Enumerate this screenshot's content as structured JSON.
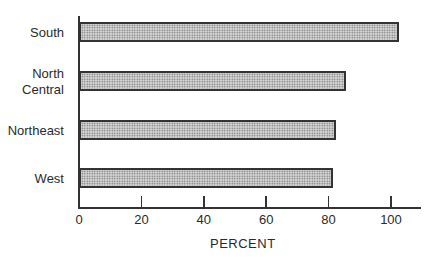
{
  "chart_data": {
    "type": "bar",
    "orientation": "horizontal",
    "title": "",
    "xlabel": "PERCENT",
    "ylabel": "",
    "categories": [
      "South",
      "North\nCentral",
      "Northeast",
      "West"
    ],
    "values": [
      102.5,
      85.5,
      82.5,
      81.5
    ],
    "xlim": [
      0,
      110
    ],
    "x_ticks": [
      0,
      20,
      40,
      60,
      80,
      100
    ],
    "x_tick_labels": [
      "0",
      "20",
      "40",
      "60",
      "80",
      "100"
    ],
    "grid": false,
    "legend": null,
    "bar_fill": "stippled gray",
    "bar_border_color": "#333333"
  },
  "layout": {
    "origin_px": 79,
    "px_per_unit": 3.12,
    "bar_tops": [
      22,
      71,
      120,
      168
    ],
    "label_tops": [
      25,
      66,
      123,
      171
    ]
  }
}
